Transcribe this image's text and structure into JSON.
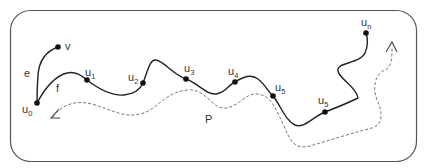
{
  "diagram": {
    "colors": {
      "frame": "#555555",
      "path_solid": "#222222",
      "path_dashed": "#666666",
      "node": "#111111",
      "label": "#333333"
    },
    "edge_labels": {
      "e": "e",
      "f": "f",
      "P": "P"
    },
    "nodes": [
      {
        "id": "v",
        "base": "v",
        "sub": ""
      },
      {
        "id": "u0",
        "base": "u",
        "sub": "0"
      },
      {
        "id": "u1",
        "base": "u",
        "sub": "1"
      },
      {
        "id": "u2",
        "base": "u",
        "sub": "2"
      },
      {
        "id": "u3",
        "base": "u",
        "sub": "3"
      },
      {
        "id": "u4",
        "base": "u",
        "sub": "4"
      },
      {
        "id": "u5a",
        "base": "u",
        "sub": "5"
      },
      {
        "id": "u5b",
        "base": "u",
        "sub": "5"
      },
      {
        "id": "un",
        "base": "u",
        "sub": "n"
      }
    ]
  }
}
